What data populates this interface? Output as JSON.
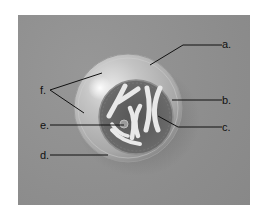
{
  "diagram": {
    "type": "labeled-cell-illustration",
    "background_color": "#8f8f8f",
    "labels": [
      {
        "id": "a",
        "text": "a.",
        "points_to": "cell membrane (top)"
      },
      {
        "id": "b",
        "text": "b.",
        "points_to": "nuclear envelope (right)"
      },
      {
        "id": "c",
        "text": "c.",
        "points_to": "chromosome"
      },
      {
        "id": "d",
        "text": "d.",
        "points_to": "outer cell edge (bottom)"
      },
      {
        "id": "e",
        "text": "e.",
        "points_to": "nucleolus"
      },
      {
        "id": "f",
        "text": "f.",
        "points_to": "cytoplasm (two leader lines)"
      }
    ]
  }
}
